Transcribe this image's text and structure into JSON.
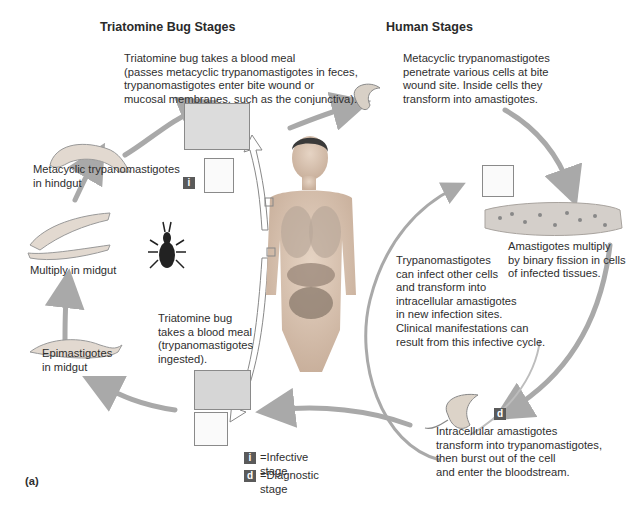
{
  "headings": {
    "bug_stages": "Triatomine Bug Stages",
    "human_stages": "Human Stages"
  },
  "steps": {
    "bug_blood_meal_infect": "Triatomine bug takes a blood meal\n(passes metacyclic trypanomastigotes in feces,\ntrypanomastigotes enter bite wound or\nmucosal membranes, such as the conjunctiva).",
    "penetrate_cells": "Metacyclic trypanomastigotes\npenetrate various cells at bite\nwound site. Inside cells they\ntransform into amastigotes.",
    "amastigotes_multiply": "Amastigotes multiply\nby binary fission in cells\nof infected tissues.",
    "reinfect": "Trypanomastigotes\ncan infect other cells\nand transform into\nintracellular amastigotes\nin new infection sites.\nClinical manifestations can\nresult from this infective cycle.",
    "transform_burst": "Intracellular amastigotes\ntransform into trypanomastigotes,\nthen burst out of the cell\nand enter the bloodstream.",
    "bug_blood_meal_ingest": "Triatomine bug\ntakes a blood meal\n(trypanomastigotes\ningested).",
    "epimastigotes": "Epimastigotes\nin midgut",
    "multiply_midgut": "Multiply in midgut",
    "metacyclic_hindgut": "Metacyclic trypanomastigotes\nin hindgut"
  },
  "badges": {
    "infective": "i",
    "diagnostic": "d"
  },
  "legend": {
    "infective_label": "=Infective stage",
    "diagnostic_label": "=Diagnostic stage"
  },
  "panel_label": "(a)",
  "colors": {
    "arrow": "#a9a9a9",
    "badge": "#5a5a5a",
    "frame": "#8a8a8a",
    "skin": "#d9c4b2"
  }
}
